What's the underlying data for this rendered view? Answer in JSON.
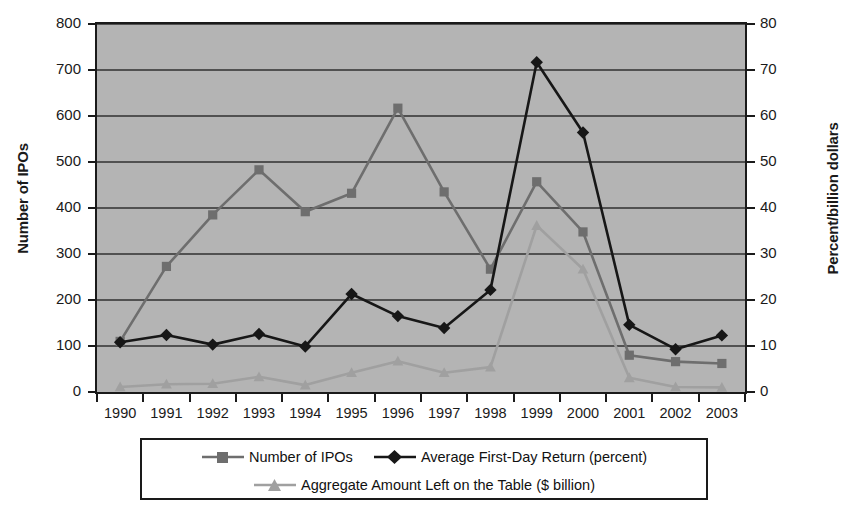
{
  "chart_data": {
    "type": "line",
    "title": "",
    "xlabel": "",
    "ylabel": "Number of IPOs",
    "ylabel_right": "Percent/billion dollars",
    "grid": true,
    "legend_position": "bottom",
    "categories": [
      "1990",
      "1991",
      "1992",
      "1993",
      "1994",
      "1995",
      "1996",
      "1997",
      "1998",
      "1999",
      "2000",
      "2001",
      "2002",
      "2003"
    ],
    "ylim": [
      0,
      800
    ],
    "yticks": [
      0,
      100,
      200,
      300,
      400,
      500,
      600,
      700,
      800
    ],
    "ylim_right": [
      0,
      80
    ],
    "yticks_right": [
      0,
      10,
      20,
      30,
      40,
      50,
      60,
      70,
      80
    ],
    "series": [
      {
        "name": "Number of IPOs",
        "axis": "left",
        "marker": "square",
        "color": "#6e6e6e",
        "values": [
          110,
          273,
          385,
          483,
          392,
          432,
          617,
          435,
          267,
          457,
          348,
          80,
          66,
          62
        ]
      },
      {
        "name": "Average First-Day Return (percent)",
        "axis": "right",
        "marker": "diamond",
        "color": "#171717",
        "values": [
          10.8,
          12.4,
          10.3,
          12.6,
          9.9,
          21.3,
          16.5,
          13.9,
          22.2,
          71.7,
          56.4,
          14.6,
          9.3,
          12.3
        ]
      },
      {
        "name": "Aggregate Amount Left on the Table ($ billion)",
        "axis": "right",
        "marker": "triangle",
        "color": "#a0a0a0",
        "values": [
          1.1,
          1.7,
          1.8,
          3.3,
          1.5,
          4.2,
          6.7,
          4.2,
          5.4,
          36.2,
          26.7,
          3.1,
          1.1,
          1.0
        ]
      }
    ]
  },
  "axes": {
    "left_title": "Number of IPOs",
    "right_title": "Percent/billion dollars",
    "left_ticks": [
      "0",
      "100",
      "200",
      "300",
      "400",
      "500",
      "600",
      "700",
      "800"
    ],
    "right_ticks": [
      "0",
      "10",
      "20",
      "30",
      "40",
      "50",
      "60",
      "70",
      "80"
    ],
    "x_ticks": [
      "1990",
      "1991",
      "1992",
      "1993",
      "1994",
      "1995",
      "1996",
      "1997",
      "1998",
      "1999",
      "2000",
      "2001",
      "2002",
      "2003"
    ]
  },
  "legend": {
    "items": [
      {
        "label": "Number of IPOs",
        "marker": "square",
        "color": "#6e6e6e"
      },
      {
        "label": "Average First-Day Return (percent)",
        "marker": "diamond",
        "color": "#171717"
      },
      {
        "label": "Aggregate Amount Left on the Table ($ billion)",
        "marker": "triangle",
        "color": "#a0a0a0"
      }
    ]
  },
  "colors": {
    "plot_background": "#b4b4b4",
    "gridline": "#303030",
    "axis": "#1a1a1a",
    "page_background": "#ffffff",
    "series_ipos": "#6e6e6e",
    "series_return": "#171717",
    "series_table": "#a0a0a0"
  }
}
